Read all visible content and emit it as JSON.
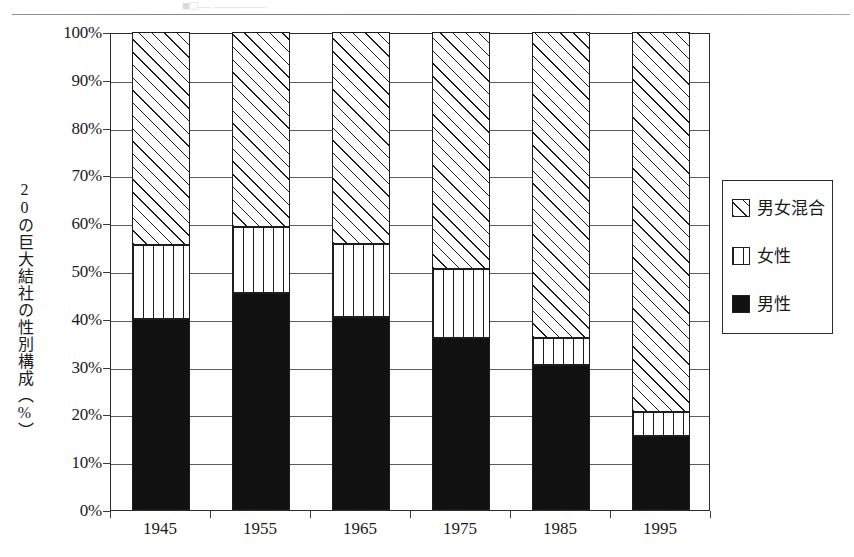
{
  "scan": {
    "top_cropped_text": "■□—   ————"
  },
  "chart_data": {
    "type": "bar",
    "subtype": "stacked-100-percent",
    "title": "",
    "xlabel": "",
    "ylabel": "20の巨大結社の性別構成（%）",
    "categories": [
      "1945",
      "1955",
      "1965",
      "1975",
      "1985",
      "1995"
    ],
    "ylim": [
      0,
      100
    ],
    "ytick_labels": [
      "100%",
      "90%",
      "80%",
      "70%",
      "60%",
      "50%",
      "40%",
      "30%",
      "20%",
      "10%",
      "0%"
    ],
    "ytick_values": [
      100,
      90,
      80,
      70,
      60,
      50,
      40,
      30,
      20,
      10,
      0
    ],
    "grid": true,
    "legend_position": "right",
    "series": [
      {
        "name": "男性",
        "key": "male",
        "pattern": "solid-black",
        "values": [
          40.0,
          45.3,
          40.3,
          36.0,
          30.4,
          15.4
        ]
      },
      {
        "name": "女性",
        "key": "female",
        "pattern": "vertical-stripes",
        "values": [
          15.4,
          14.0,
          15.4,
          14.4,
          5.6,
          5.2
        ]
      },
      {
        "name": "男女混合",
        "key": "mixed",
        "pattern": "diagonal-hatch",
        "values": [
          44.6,
          40.7,
          44.3,
          49.6,
          64.0,
          79.4
        ]
      }
    ]
  },
  "legend": {
    "items": [
      {
        "label": "男女混合",
        "pattern": "diagonal-hatch"
      },
      {
        "label": "女性",
        "pattern": "vertical-stripes"
      },
      {
        "label": "男性",
        "pattern": "solid-black"
      }
    ]
  },
  "colors": {
    "ink": "#1d1d1d",
    "grid": "#5c5c60",
    "frame": "#2b2b2b",
    "paper": "#ffffff"
  }
}
